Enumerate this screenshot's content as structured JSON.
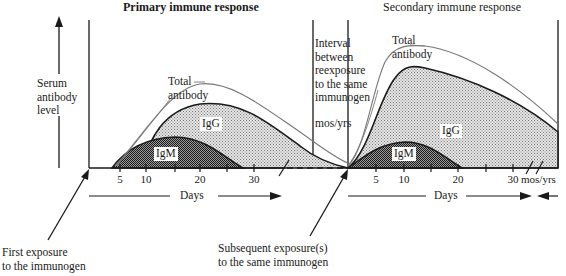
{
  "titles": {
    "primary": "Primary immune response",
    "secondary": "Secondary immune response"
  },
  "y_axis": {
    "label_lines": [
      "Serum",
      "antibody",
      "level"
    ]
  },
  "interval_note": {
    "lines": [
      "Interval",
      "between",
      "reexposure",
      "to the same",
      "immunogen"
    ],
    "unit": "mos/yrs"
  },
  "curve_labels": {
    "total_primary": [
      "Total",
      "antibody"
    ],
    "total_secondary": [
      "Total",
      "antibody"
    ],
    "igg_primary": "IgG",
    "igm_primary": "IgM",
    "igg_secondary": "IgG",
    "igm_secondary": "IgM"
  },
  "x_axis": {
    "primary_ticks": [
      "5",
      "10",
      "20",
      "30"
    ],
    "secondary_ticks": [
      "5",
      "10",
      "20",
      "30"
    ],
    "secondary_end_unit": "mos/yrs",
    "days_label_primary": "Days",
    "days_label_secondary": "Days"
  },
  "annotations": {
    "first_exposure": [
      "First exposure",
      "to the immunogen"
    ],
    "subsequent_exposure": [
      "Subsequent exposure(s)",
      "to the same immunogen"
    ]
  },
  "colors": {
    "ink": "#1a1a1a",
    "total_line": "#777777",
    "igg_fill": "#c8c8c8",
    "igm_fill": "#555555",
    "background": "#ffffff"
  }
}
